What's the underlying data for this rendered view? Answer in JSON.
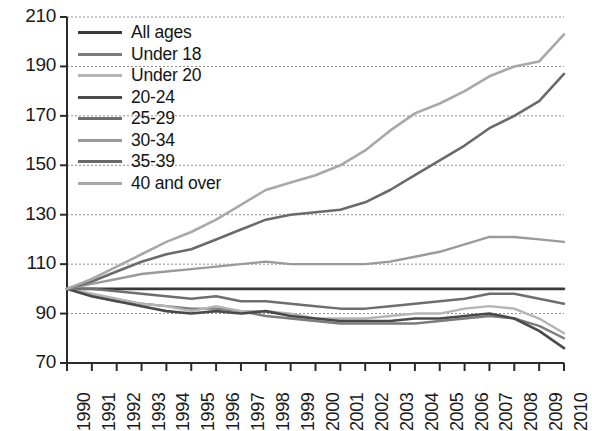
{
  "chart_data": {
    "type": "line",
    "title": "",
    "subtitle": "",
    "xlabel": "",
    "ylabel": "",
    "xlim": [
      1990,
      2010
    ],
    "ylim": [
      70,
      210
    ],
    "grid": true,
    "grid_axis": "y",
    "legend_position": "top-left",
    "x": [
      1990,
      1991,
      1992,
      1993,
      1994,
      1995,
      1996,
      1997,
      1998,
      1999,
      2000,
      2001,
      2002,
      2003,
      2004,
      2005,
      2006,
      2007,
      2008,
      2009,
      2010
    ],
    "y_ticks": [
      70,
      90,
      110,
      130,
      150,
      170,
      190,
      210
    ],
    "x_ticks": [
      "1990",
      "1991",
      "1992",
      "1993",
      "1994",
      "1995",
      "1996",
      "1997",
      "1998",
      "1999",
      "2000",
      "2001",
      "2002",
      "2003",
      "2004",
      "2005",
      "2006",
      "2007",
      "2008",
      "2009",
      "2010"
    ],
    "series": [
      {
        "name": "All ages",
        "color": "#3a3a3a",
        "width": 2.6,
        "values": [
          100,
          100,
          100,
          100,
          100,
          100,
          100,
          100,
          100,
          100,
          100,
          100,
          100,
          100,
          100,
          100,
          100,
          100,
          100,
          100,
          100
        ]
      },
      {
        "name": "Under 18",
        "color": "#7c7c7c",
        "width": 2.4,
        "values": [
          100,
          97,
          95,
          94,
          93,
          92,
          92,
          91,
          89,
          88,
          87,
          86,
          86,
          86,
          86,
          87,
          88,
          89,
          88,
          85,
          80
        ]
      },
      {
        "name": "Under 20",
        "color": "#b4b4b4",
        "width": 2.4,
        "values": [
          100,
          98,
          96,
          94,
          93,
          91,
          93,
          91,
          91,
          90,
          88,
          88,
          88,
          89,
          90,
          90,
          92,
          93,
          92,
          88,
          82
        ]
      },
      {
        "name": "20-24",
        "color": "#4a4a4a",
        "width": 2.6,
        "values": [
          100,
          97,
          95,
          93,
          91,
          90,
          91,
          90,
          91,
          89,
          88,
          87,
          87,
          87,
          88,
          88,
          89,
          90,
          88,
          83,
          76
        ]
      },
      {
        "name": "25-29",
        "color": "#6e6e6e",
        "width": 2.5,
        "values": [
          100,
          100,
          99,
          98,
          97,
          96,
          97,
          95,
          95,
          94,
          93,
          92,
          92,
          93,
          94,
          95,
          96,
          98,
          98,
          96,
          94
        ]
      },
      {
        "name": "30-34",
        "color": "#9a9a9a",
        "width": 2.4,
        "values": [
          100,
          102,
          104,
          106,
          107,
          108,
          109,
          110,
          111,
          110,
          110,
          110,
          110,
          111,
          113,
          115,
          118,
          121,
          121,
          120,
          119
        ]
      },
      {
        "name": "35-39",
        "color": "#6a6a6a",
        "width": 2.6,
        "values": [
          100,
          103,
          107,
          111,
          114,
          116,
          120,
          124,
          128,
          130,
          131,
          132,
          135,
          140,
          146,
          152,
          158,
          165,
          170,
          176,
          187
        ]
      },
      {
        "name": "40 and over",
        "color": "#a8a8a8",
        "width": 2.6,
        "values": [
          100,
          104,
          109,
          114,
          119,
          123,
          128,
          134,
          140,
          143,
          146,
          150,
          156,
          164,
          171,
          175,
          180,
          186,
          190,
          192,
          203
        ]
      }
    ],
    "axis_color": "#2b2b2b",
    "grid_color": "#8c8c8c"
  },
  "legend": {
    "items": [
      {
        "label": "All ages"
      },
      {
        "label": "Under 18"
      },
      {
        "label": "Under 20"
      },
      {
        "label": "20-24"
      },
      {
        "label": "25-29"
      },
      {
        "label": "30-34"
      },
      {
        "label": "35-39"
      },
      {
        "label": "40 and over"
      }
    ]
  }
}
